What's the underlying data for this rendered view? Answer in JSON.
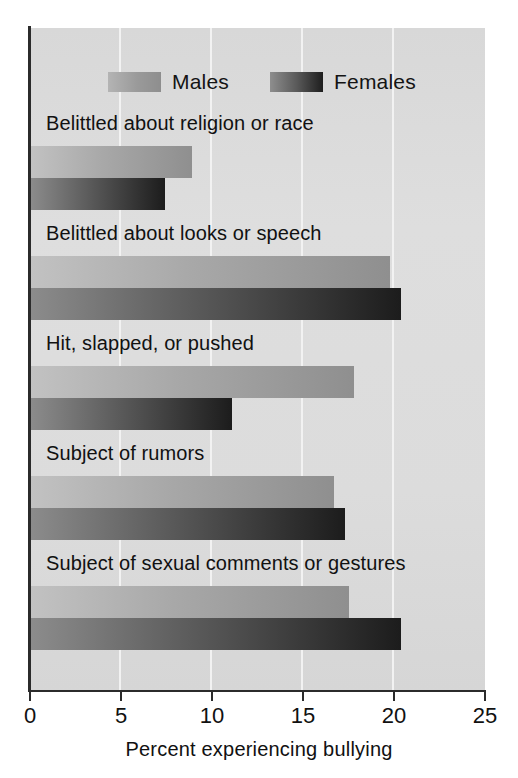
{
  "chart_data": {
    "type": "bar",
    "orientation": "horizontal",
    "title": "",
    "xlabel": "Percent experiencing bullying",
    "ylabel": "",
    "xlim": [
      0,
      25
    ],
    "xticks": [
      0,
      5,
      10,
      15,
      20,
      25
    ],
    "grid": true,
    "grid_axis": "x",
    "legend_position": "top",
    "categories": [
      "Belittled about religion or race",
      "Belittled about looks or speech",
      "Hit, slapped, or pushed",
      "Subject of rumors",
      "Subject of sexual comments or gestures"
    ],
    "series": [
      {
        "name": "Males",
        "values": [
          8.9,
          19.8,
          17.8,
          16.7,
          17.5
        ],
        "color": "#a8a8a8"
      },
      {
        "name": "Females",
        "values": [
          7.4,
          20.4,
          11.1,
          17.3,
          20.4
        ],
        "color": "#3a3a3a"
      }
    ]
  },
  "legend": {
    "entries": [
      {
        "label": "Males",
        "swatch": "males-swatch"
      },
      {
        "label": "Females",
        "swatch": "females-swatch"
      }
    ]
  },
  "axis": {
    "x_title": "Percent experiencing bullying",
    "tick_labels": [
      "0",
      "5",
      "10",
      "15",
      "20",
      "25"
    ]
  },
  "colors": {
    "panel_background": "#dcdcdc",
    "gridline": "#f2f2f2",
    "axis": "#2b2b2b",
    "males_light": "#c2c2c2",
    "males_dark": "#8f8f8f",
    "females_light": "#8c8c8c",
    "females_dark": "#1c1c1c",
    "text": "#111111",
    "page_background": "#ffffff"
  }
}
